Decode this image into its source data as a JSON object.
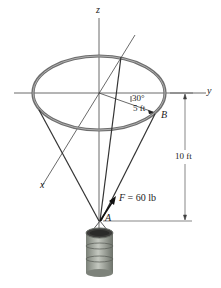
{
  "diagram": {
    "type": "statics-3d-cable-ring",
    "axes": {
      "x_label": "x",
      "y_label": "y",
      "z_label": "z"
    },
    "angle_label": "30°",
    "radius_label": "5 ft",
    "point_b_label": "B",
    "point_a_label": "A",
    "force_label_var": "F",
    "force_label_value": "= 60 lb",
    "height_label": "10 ft",
    "colors": {
      "line": "#333333",
      "ring": "#6e6e6e",
      "ring_inner": "#a8a8a8",
      "axis": "#444444",
      "barrel": "#8e9488",
      "barrel_top": "#3a3a3a"
    }
  }
}
